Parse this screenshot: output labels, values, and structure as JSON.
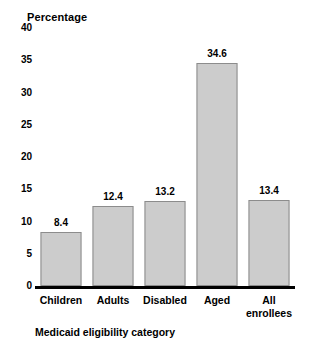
{
  "chart_data": {
    "type": "bar",
    "title": "",
    "ylabel": "Percentage",
    "xlabel": "Medicaid eligibility category",
    "categories": [
      "Children",
      "Adults",
      "Disabled",
      "Aged",
      "All enrollees"
    ],
    "values": [
      8.4,
      12.4,
      13.2,
      34.6,
      13.4
    ],
    "value_labels": [
      "8.4",
      "12.4",
      "13.2",
      "34.6",
      "13.4"
    ],
    "ylim": [
      0,
      40
    ],
    "yticks": [
      0,
      5,
      10,
      15,
      20,
      25,
      30,
      35,
      40
    ],
    "ytick_labels": [
      "0",
      "5",
      "10",
      "15",
      "20",
      "25",
      "30",
      "35",
      "40"
    ],
    "grid": false,
    "legend": "none",
    "bar_fill_color": "#cccccc",
    "bar_border_color": "#8c8c8c",
    "axis_color": "#000000",
    "text_color": "#000000",
    "background_color": "#ffffff"
  }
}
